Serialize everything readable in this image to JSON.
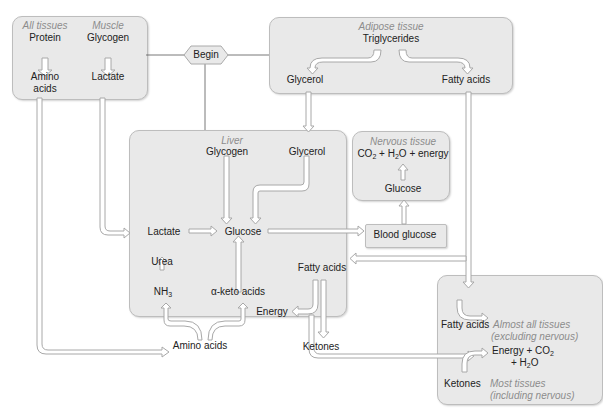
{
  "begin": "Begin",
  "all_tissues": {
    "label": "All tissues",
    "from": "Protein",
    "to_line1": "Amino",
    "to_line2": "acids"
  },
  "muscle": {
    "label": "Muscle",
    "from": "Glycogen",
    "to": "Lactate"
  },
  "adipose": {
    "label": "Adipose tissue",
    "source": "Triglycerides",
    "left": "Glycerol",
    "right": "Fatty acids"
  },
  "liver": {
    "label": "Liver",
    "glycogen": "Glycogen",
    "glycerol": "Glycerol",
    "lactate": "Lactate",
    "glucose": "Glucose",
    "urea": "Urea",
    "nh3": "NH",
    "nh3_sub": "3",
    "keto": "α-keto acids",
    "fatty_acids": "Fatty acids",
    "energy": "Energy",
    "amino_acids": "Amino acids",
    "ketones": "Ketones"
  },
  "blood_glucose": "Blood glucose",
  "nervous": {
    "label": "Nervous tissue",
    "co2": "CO",
    "co2_sub": "2",
    "plus1": " + H",
    "h2o_sub": "2",
    "rest": "O + energy",
    "glucose": "Glucose"
  },
  "other_tissues": {
    "fatty_acids": "Fatty acids",
    "almost_all_line1": "Almost all tissues",
    "almost_all_line2": "(excluding nervous)",
    "energy_line1": "Energy + CO",
    "energy_sub": "2",
    "energy_line2_a": "+ H",
    "energy_line2_sub": "2",
    "energy_line2_b": "O",
    "ketones": "Ketones",
    "most_line1": "Most tissues",
    "most_line2": "(including nervous)"
  },
  "colors": {
    "box_fill": "#e9e9e9",
    "box_border": "#bdbdbd",
    "label_gray": "#8c8c8c",
    "text": "#222222",
    "arrow_fill": "#ffffff",
    "arrow_stroke": "#a8a8a8"
  }
}
